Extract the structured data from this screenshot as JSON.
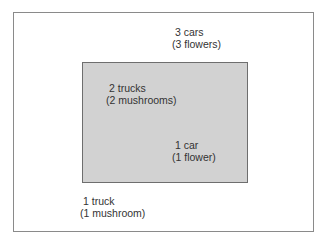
{
  "diagram": {
    "outer_region": {
      "label_line1": "3 cars",
      "label_line2": "(3 flowers)"
    },
    "inner_region": {
      "label_top_line1": "2 trucks",
      "label_top_line2": "(2 mushrooms)",
      "label_bottom_line1": "1 car",
      "label_bottom_line2": "(1 flower)"
    },
    "outside_label": {
      "line1": "1 truck",
      "line2": "(1 mushroom)"
    },
    "colors": {
      "background": "#ffffff",
      "outer_border": "#8a8a8a",
      "inner_fill": "#d2d2d2",
      "inner_border": "#6e6e6e",
      "text": "#333333"
    }
  }
}
